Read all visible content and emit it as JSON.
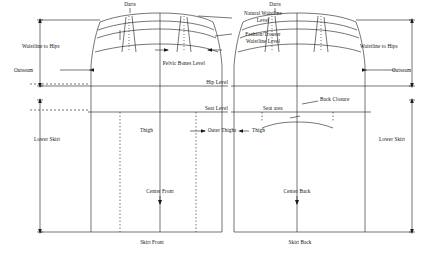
{
  "diagram": {
    "labels": {
      "darts_front": "Darts",
      "darts_back": "Darts",
      "natural_waistline_level": "Natural Waistline\nLevel",
      "waistline_to_hips_left": "Waistline to Hips",
      "waistline_to_hips_right": "Waistline to Hips",
      "fashion_trouser_waistline_level": "Fashion/Trouser\nWaistline Level",
      "pelvic_bones_level": "Pelvic Bones Level",
      "outseam_left": "Outseam",
      "outseam_right": "Outseam",
      "hip_level": "Hip Level",
      "seat_level": "Seat Level",
      "seat_area": "Seat area",
      "back_closure": "Back Closure",
      "thigh_front": "Thigh",
      "thigh_back": "Thigh",
      "outer_thighs": "Outer Thighs",
      "lower_skirt_left": "Lower Skirt",
      "lower_skirt_right": "Lower Skirt",
      "center_front": "Center Front",
      "center_back": "Center Back",
      "skirt_front": "Skirt Front",
      "skirt_back": "Skirt Back"
    },
    "colors": {
      "line": "#1a1a1a",
      "text": "#111111",
      "background": "#ffffff"
    }
  }
}
